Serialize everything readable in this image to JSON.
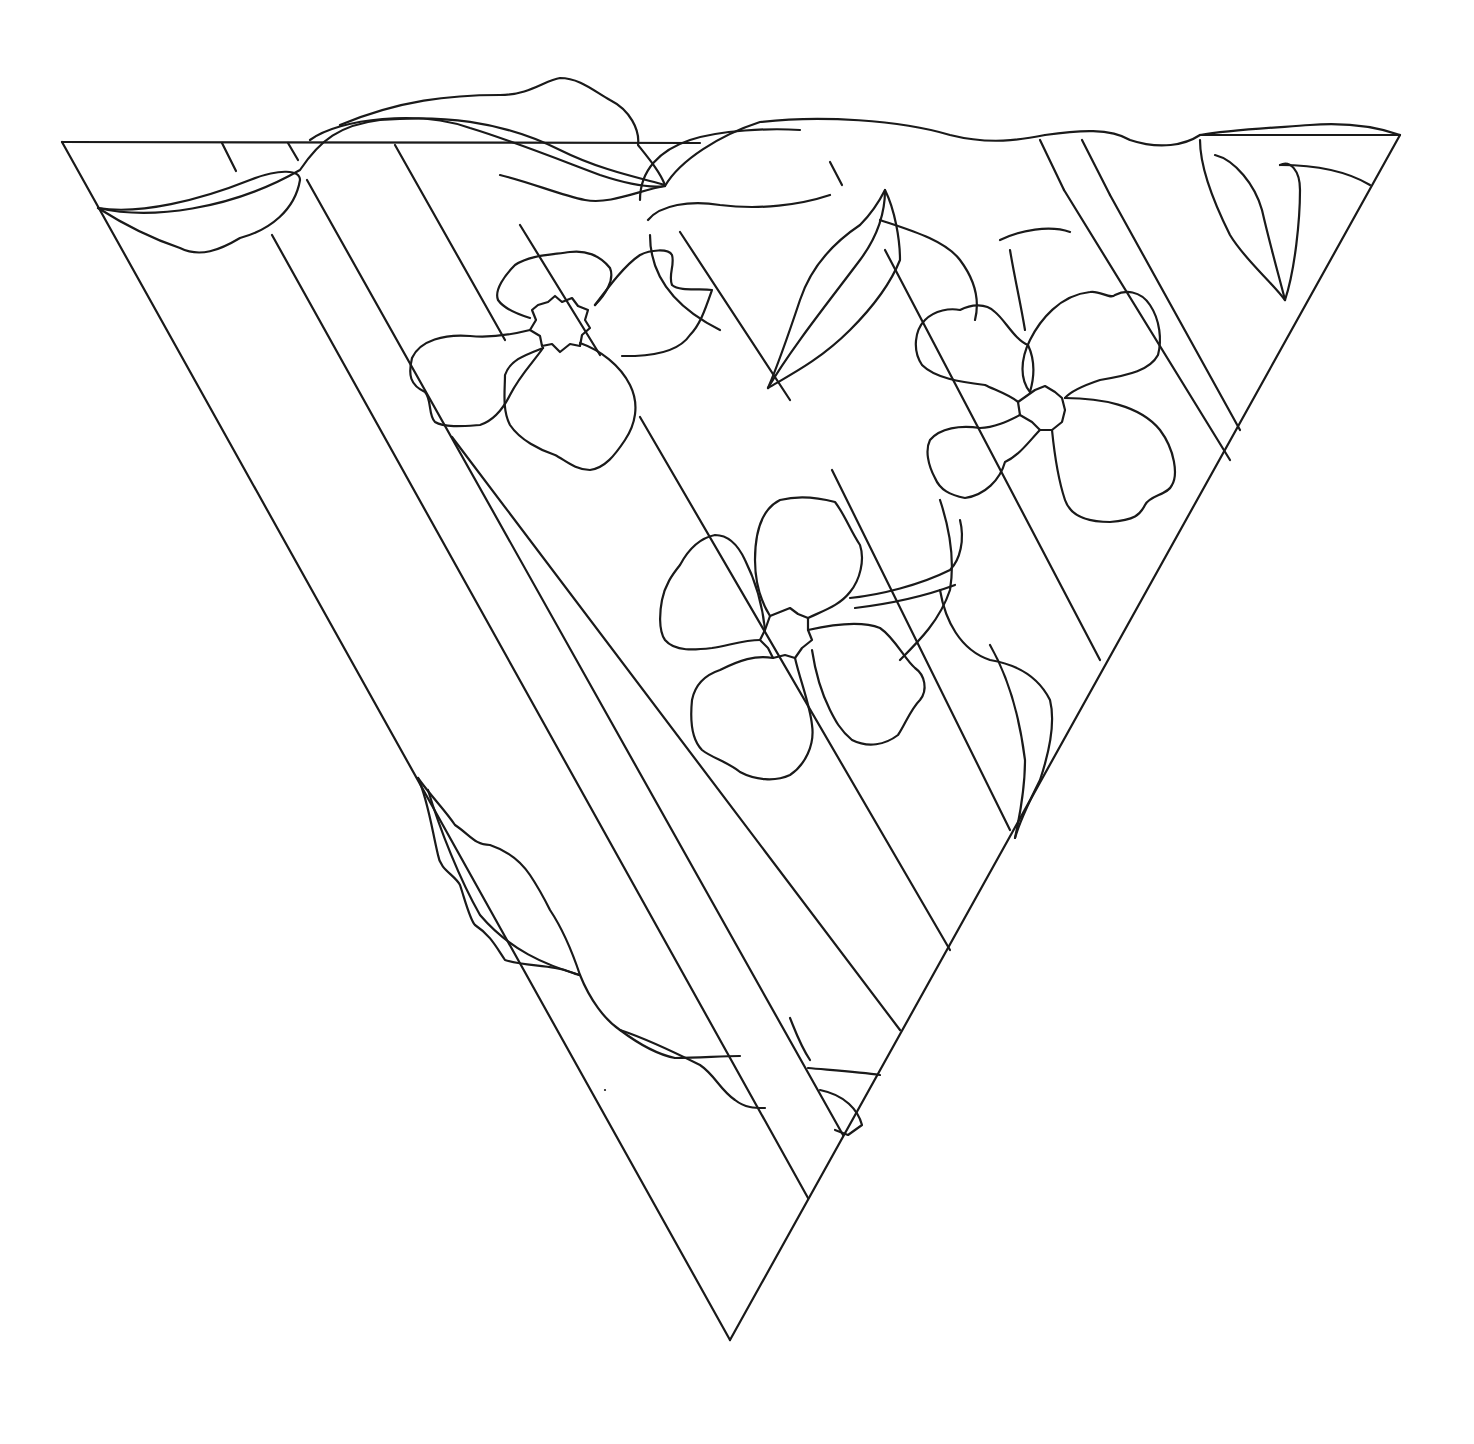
{
  "artwork": {
    "subject": "Stained-glass pattern: inverted triangle with diagonal stripes, three four-petal flowers, vines and leaves",
    "style": "black line art on white",
    "colors": {
      "background": "#ffffff",
      "line": "#1a1a1a"
    },
    "elements": {
      "frame": "inverted-triangle",
      "stripes": 9,
      "flowers": 3,
      "leaves": 8
    }
  }
}
